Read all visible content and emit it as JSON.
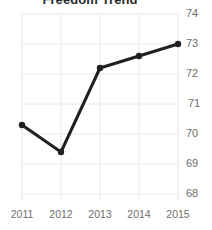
{
  "chart_data": {
    "type": "line",
    "title": "Freedom Trend",
    "xlabel": "",
    "ylabel": "",
    "categories": [
      "2011",
      "2012",
      "2013",
      "2014",
      "2015"
    ],
    "x": [
      2011,
      2012,
      2013,
      2014,
      2015
    ],
    "values": [
      70.3,
      69.4,
      72.2,
      72.6,
      73.0
    ],
    "series": [
      {
        "name": "Freedom Score",
        "values": [
          70.3,
          69.4,
          72.2,
          72.6,
          73.0
        ]
      }
    ],
    "ylim": [
      68,
      74
    ],
    "yticks": [
      68,
      69,
      70,
      71,
      72,
      73,
      74
    ],
    "ytick_labels": [
      "68",
      "69",
      "70",
      "71",
      "72",
      "73",
      "74"
    ],
    "xticks": [
      2011,
      2012,
      2013,
      2014,
      2015
    ],
    "xtick_labels": [
      "2011",
      "2012",
      "2013",
      "2014",
      "2015"
    ],
    "grid": true,
    "legend": false,
    "legend_position": "none",
    "line_color": "#231f20",
    "marker_color": "#231f20",
    "grid_color": "#e8e8ea",
    "tick_label_color": "#6e6e6e",
    "title_color": "#2b2b2b",
    "y_axis_side": "right"
  }
}
